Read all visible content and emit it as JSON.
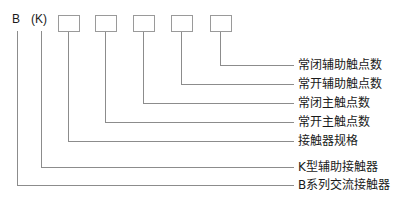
{
  "diagram": {
    "type": "model-designation-breakdown",
    "colors": {
      "line": "#8c8c8c",
      "box_stroke": "#9a9a9a",
      "box_fill": "#ffffff",
      "text": "#1a1a1a",
      "background": "#ffffff"
    },
    "code_segments": [
      {
        "id": "seg-b",
        "text": "B",
        "x": 12,
        "y": 26,
        "anchor_x": 17
      },
      {
        "id": "seg-k",
        "text": "(K)",
        "x": 31,
        "y": 26,
        "anchor_x": 41
      },
      {
        "id": "seg-box-1",
        "text": "",
        "x": 58,
        "y": 15,
        "anchor_x": 68
      },
      {
        "id": "seg-box-2",
        "text": "",
        "x": 95,
        "y": 15,
        "anchor_x": 105
      },
      {
        "id": "seg-box-3",
        "text": "",
        "x": 133,
        "y": 15,
        "anchor_x": 143
      },
      {
        "id": "seg-box-4",
        "text": "",
        "x": 171,
        "y": 15,
        "anchor_x": 181
      },
      {
        "id": "seg-box-5",
        "text": "",
        "x": 210,
        "y": 15,
        "anchor_x": 220
      }
    ],
    "boxes": [
      {
        "name": "box-1",
        "x": 58,
        "y": 15,
        "w": 21,
        "h": 16
      },
      {
        "name": "box-2",
        "x": 95,
        "y": 15,
        "w": 21,
        "h": 16
      },
      {
        "name": "box-3",
        "x": 133,
        "y": 15,
        "w": 21,
        "h": 16
      },
      {
        "name": "box-4",
        "x": 171,
        "y": 15,
        "w": 21,
        "h": 16
      },
      {
        "name": "box-5",
        "x": 210,
        "y": 15,
        "w": 21,
        "h": 16
      }
    ],
    "callouts": [
      {
        "key": "normally-closed-auxiliary-contacts",
        "label": "常闭辅助触点数",
        "from_x": 220,
        "from_y": 31,
        "elbow_y": 65,
        "to_x": 294,
        "text_x": 298,
        "text_y": 59
      },
      {
        "key": "normally-open-auxiliary-contacts",
        "label": "常开辅助触点数",
        "from_x": 181,
        "from_y": 31,
        "elbow_y": 84,
        "to_x": 294,
        "text_x": 298,
        "text_y": 78
      },
      {
        "key": "normally-closed-main-contacts",
        "label": "常闭主触点数",
        "from_x": 143,
        "from_y": 31,
        "elbow_y": 103,
        "to_x": 294,
        "text_x": 298,
        "text_y": 97
      },
      {
        "key": "normally-open-main-contacts",
        "label": "常开主触点数",
        "from_x": 105,
        "from_y": 31,
        "elbow_y": 122,
        "to_x": 294,
        "text_x": 298,
        "text_y": 116
      },
      {
        "key": "contactor-specification",
        "label": "接触器规格",
        "from_x": 68,
        "from_y": 31,
        "elbow_y": 141,
        "to_x": 294,
        "text_x": 298,
        "text_y": 135
      },
      {
        "key": "k-type-auxiliary-contactor",
        "label": "K型辅助接触器",
        "from_x": 41,
        "from_y": 31,
        "elbow_y": 167,
        "to_x": 294,
        "text_x": 298,
        "text_y": 161
      },
      {
        "key": "b-series-ac-contactor",
        "label": "B系列交流接触器",
        "from_x": 17,
        "from_y": 31,
        "elbow_y": 185,
        "to_x": 294,
        "text_x": 298,
        "text_y": 179
      }
    ]
  }
}
